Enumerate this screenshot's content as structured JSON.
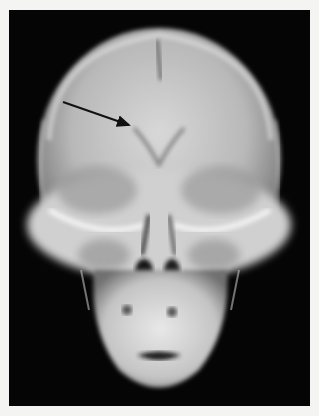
{
  "image": {
    "subject": "Frontal (PA) skull radiograph",
    "frame_color": "#050505",
    "background_color": "#f4f4f2",
    "annotation": {
      "type": "arrow",
      "start": [
        63,
        102
      ],
      "end": [
        131,
        126
      ],
      "color": "#111111"
    }
  }
}
